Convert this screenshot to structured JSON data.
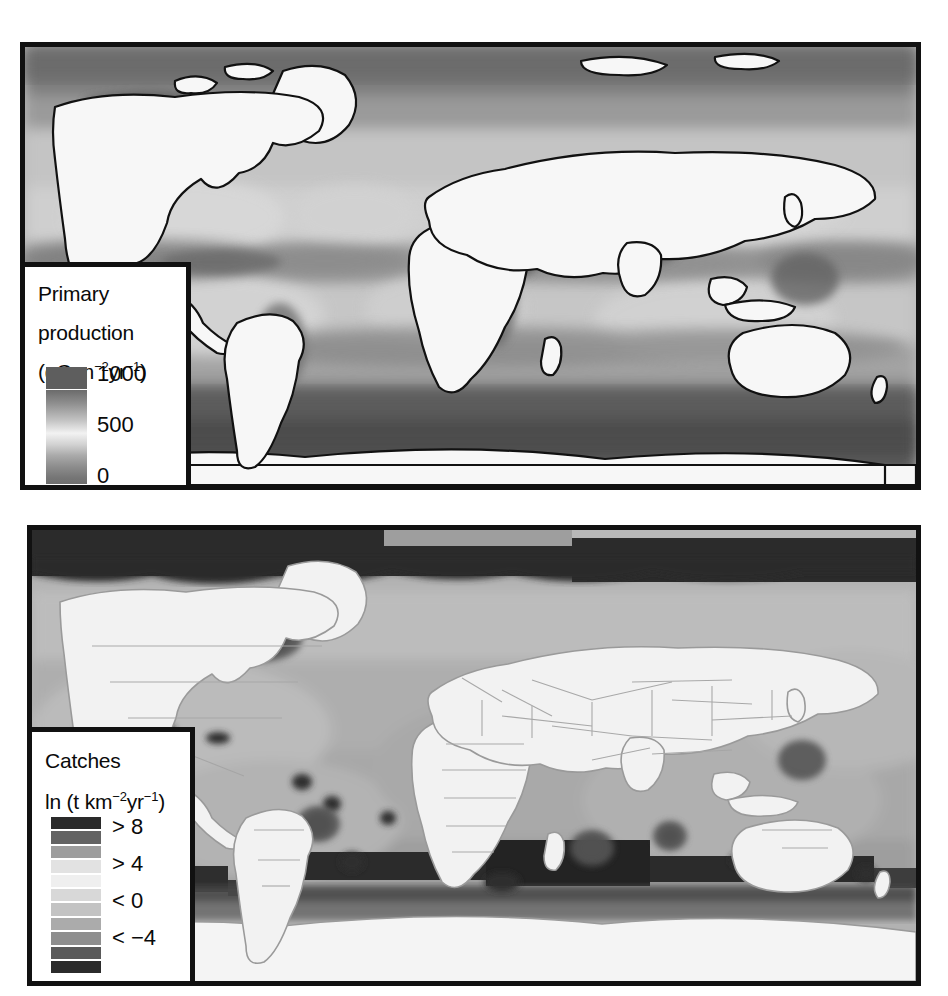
{
  "figure": {
    "type": "two-panel global map figure",
    "background": "#ffffff",
    "width": 948,
    "height": 996
  },
  "panels": [
    {
      "id": "primary-production",
      "variable": "Primary production",
      "projection": "cylindrical equidistant world map",
      "land_color": "#f7f7f7",
      "coastline_color": "#111111",
      "frame_color": "#111111",
      "description": "Grayscale global ocean primary production map; dark bands along equator, coastal upwelling zones and high latitudes; light subtropical gyres."
    },
    {
      "id": "catches",
      "variable": "Catches",
      "projection": "cylindrical equidistant world map",
      "land_color": "#f2f2f2",
      "coastline_color": "#9a9a9a",
      "frame_color": "#111111",
      "description": "Grayscale global fisheries catch map with country EEZ boundaries, dark polar blocks and dark high-catch patches."
    }
  ],
  "legend_primary_production": {
    "title_line1": "Primary",
    "title_line2": "production",
    "units_prefix": "(gC m",
    "units_sup1": "−2",
    "units_mid": "yr",
    "units_sup2": "−1",
    "units_suffix": ")",
    "units_plain": "(gC m−2yr−1)",
    "scale_type": "continuous",
    "ticks": [
      "1000",
      "500",
      "0"
    ],
    "tick_values": [
      1000,
      500,
      0
    ],
    "colorbar_top_block": "#5e5e5e",
    "colorbar_gradient_stops": [
      "#6b6b6b",
      "#8e8e8e",
      "#c2c2c2",
      "#f2f2f2",
      "#d2d2d2",
      "#a9a9a9",
      "#8c8c8c",
      "#767676",
      "#6e6e6e"
    ]
  },
  "legend_catches": {
    "title_line1": "Catches",
    "units_prefix": "ln (t km",
    "units_sup1": "−2",
    "units_mid": "yr",
    "units_sup2": "−1",
    "units_suffix": ")",
    "units_plain": "ln (t km−2yr−1)",
    "scale_type": "discrete",
    "labels": [
      "> 8",
      "> 4",
      "< 0",
      "< −4"
    ],
    "label_values": [
      8,
      4,
      0,
      -4
    ],
    "swatches": [
      "#2a2a2a",
      "#636363",
      "#9d9d9d",
      "#e2e2e2",
      "#efefef",
      "#d8d8d8",
      "#c3c3c3",
      "#ababab",
      "#8e8e8e",
      "#5a5a5a",
      "#2b2b2b"
    ],
    "swatch_count": 11
  },
  "chart_data": {
    "type": "heatmap",
    "title": "",
    "maps": [
      {
        "name": "Primary production",
        "ylabel": "Primary production (gC m−2yr−1)",
        "colorbar_ticks": [
          0,
          500,
          1000
        ],
        "legend_position": "lower-left inside panel",
        "grid": false
      },
      {
        "name": "Catches",
        "ylabel": "Catches ln (t km−2yr−1)",
        "colorbar_ticks": [
          -4,
          0,
          4,
          8
        ],
        "legend_position": "lower-left inside panel",
        "grid": false
      }
    ]
  }
}
